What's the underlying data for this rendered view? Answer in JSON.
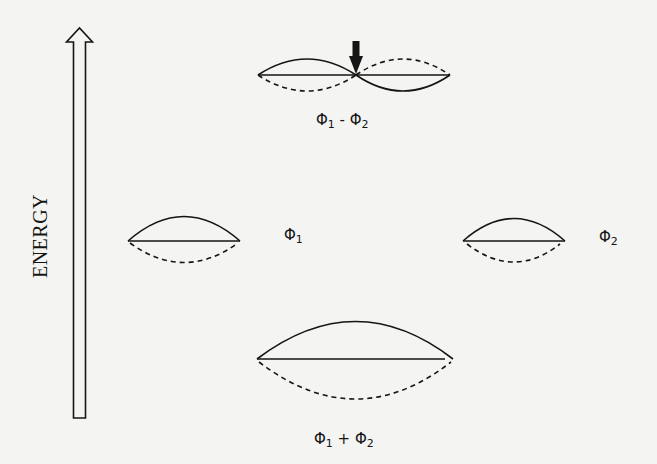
{
  "diagram": {
    "axis": {
      "label": "ENERGY",
      "direction": "up",
      "icon": "hollow-up-arrow-icon"
    },
    "colors": {
      "ink": "#151515",
      "background": "#f4f4f2"
    },
    "orbitals": [
      {
        "id": "antibonding",
        "label_base": "Φ",
        "label_parts": [
          "Φ",
          "1",
          " - ",
          "Φ",
          "2"
        ],
        "label": "Φ1 - Φ2",
        "level": "high",
        "has_node": true,
        "node_marker": "down-arrow-icon"
      },
      {
        "id": "phi1",
        "label_parts": [
          "Φ",
          "1"
        ],
        "label": "Φ1",
        "level": "middle-left"
      },
      {
        "id": "phi2",
        "label_parts": [
          "Φ",
          "2"
        ],
        "label": "Φ2",
        "level": "middle-right"
      },
      {
        "id": "bonding",
        "label_parts": [
          "Φ",
          "1",
          " + ",
          "Φ",
          "2"
        ],
        "label": "Φ1 + Φ2",
        "level": "low",
        "has_node": false
      }
    ]
  }
}
